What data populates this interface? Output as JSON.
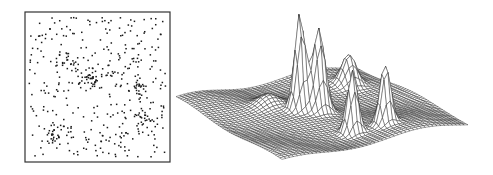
{
  "figure": {
    "panels": [
      {
        "id": "scatter",
        "description": "Point pattern with clusters embedded in uniform background noise"
      },
      {
        "id": "surface",
        "description": "3D wireframe density surface with peaks at cluster locations"
      }
    ],
    "colors": {
      "ink": "#1a1a1a",
      "background": "#ffffff",
      "frame": "#333333"
    }
  },
  "chart_data": [
    {
      "type": "scatter",
      "title": "",
      "xlabel": "",
      "ylabel": "",
      "frame": {
        "x": 25,
        "y": 12,
        "width": 145,
        "height": 150
      },
      "background_points": 360,
      "clusters": [
        {
          "name": "cluster-upper-left",
          "cx": 0.3,
          "cy": 0.33,
          "spread": [
            0.06,
            0.02
          ],
          "n": 18
        },
        {
          "name": "cluster-center",
          "cx": 0.47,
          "cy": 0.44,
          "spread": [
            0.05,
            0.035
          ],
          "n": 30,
          "angle": -35
        },
        {
          "name": "cluster-right-upper",
          "cx": 0.79,
          "cy": 0.52,
          "spread": [
            0.025,
            0.03
          ],
          "n": 22
        },
        {
          "name": "cluster-right-lower",
          "cx": 0.82,
          "cy": 0.7,
          "spread": [
            0.025,
            0.03
          ],
          "n": 20
        },
        {
          "name": "cluster-lower-left",
          "cx": 0.2,
          "cy": 0.83,
          "spread": [
            0.02,
            0.035
          ],
          "n": 20
        }
      ]
    },
    {
      "type": "surface",
      "title": "",
      "grid": true,
      "grid_resolution": 48,
      "corners": {
        "left": [
          6,
          100
        ],
        "back": [
          188,
          65
        ],
        "right": [
          298,
          124
        ],
        "front": [
          112,
          160
        ]
      },
      "peaks": [
        {
          "name": "peak-lower-left",
          "u": 0.83,
          "v": 0.2,
          "height": 30,
          "width": 0.035
        },
        {
          "name": "peak-center-a",
          "u": 0.42,
          "v": 0.44,
          "height": 95,
          "width": 0.025
        },
        {
          "name": "peak-center-b",
          "u": 0.5,
          "v": 0.48,
          "height": 82,
          "width": 0.03
        },
        {
          "name": "peak-right-upper",
          "u": 0.5,
          "v": 0.79,
          "height": 62,
          "width": 0.025
        },
        {
          "name": "peak-right-lower",
          "u": 0.66,
          "v": 0.82,
          "height": 60,
          "width": 0.025
        },
        {
          "name": "peak-upper-left",
          "u": 0.33,
          "v": 0.3,
          "height": 10,
          "width": 0.05
        }
      ],
      "background_undulation": 4
    }
  ]
}
